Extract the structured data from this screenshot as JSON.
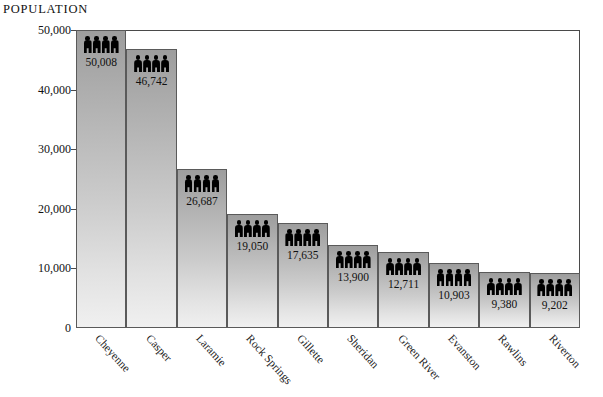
{
  "axis": {
    "y_title": "POPULATION",
    "y_ticks": [
      "0",
      "10,000",
      "20,000",
      "30,000",
      "40,000",
      "50,000"
    ],
    "y_tick_values": [
      0,
      10000,
      20000,
      30000,
      40000,
      50000
    ]
  },
  "annotation": {
    "total_label": "TOTAL POPULATION:",
    "total_value": "494,000  (2000 estimated)"
  },
  "icons": {
    "person": "person-icon",
    "people_per_bar": 4
  },
  "chart_data": {
    "type": "bar",
    "title": "",
    "subtitle": "",
    "xlabel": "",
    "ylabel": "POPULATION",
    "ylim": [
      0,
      50000
    ],
    "grid": false,
    "legend": "none",
    "categories": [
      "Cheyenne",
      "Casper",
      "Laramie",
      "Rock Springs",
      "Gillette",
      "Sheridan",
      "Green River",
      "Evanston",
      "Rawlins",
      "Riverton"
    ],
    "values": [
      50008,
      46742,
      26687,
      19050,
      17635,
      13900,
      12711,
      10903,
      9380,
      9202
    ],
    "value_labels": [
      "50,008",
      "46,742",
      "26,687",
      "19,050",
      "17,635",
      "13,900",
      "12,711",
      "10,903",
      "9,380",
      "9,202"
    ],
    "annotations": [
      "TOTAL POPULATION:",
      "494,000  (2000 estimated)"
    ]
  },
  "colors": {
    "bar_top": "#9d9d9d",
    "bar_bottom": "#f0f0f0",
    "bar_border": "#5a5a5a",
    "axis": "#3c3c3c",
    "text": "#111111",
    "icon": "#000000",
    "background": "#ffffff"
  }
}
